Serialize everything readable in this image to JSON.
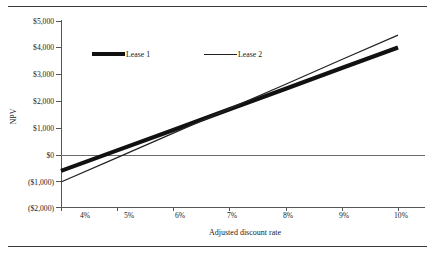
{
  "figure": {
    "top_caption": "",
    "axis_title_y": "NPV",
    "axis_title_x": "Adjusted discount rate"
  },
  "legend": {
    "items": [
      {
        "label": "Lease 1",
        "style": "thick"
      },
      {
        "label": "Lease 2",
        "style": "thin"
      }
    ]
  },
  "axes": {
    "y_ticks": [
      "$5,000",
      "$4,000",
      "$3,000",
      "$2,000",
      "$1,000",
      "$0",
      "($1,000)",
      "($2,000)"
    ],
    "x_ticks": [
      "4%",
      "5%",
      "6%",
      "7%",
      "8%",
      "9%",
      "10%"
    ]
  },
  "chart_data": {
    "type": "line",
    "title": "",
    "xlabel": "Adjusted discount rate",
    "ylabel": "NPV",
    "x": [
      4,
      5,
      6,
      7,
      8,
      9,
      10
    ],
    "x_tick_labels": [
      "4%",
      "5%",
      "6%",
      "7%",
      "8%",
      "9%",
      "10%"
    ],
    "y_tick_labels": [
      "$5,000",
      "$4,000",
      "$3,000",
      "$2,000",
      "$1,000",
      "$0",
      "($1,000)",
      "($2,000)"
    ],
    "y_tick_values": [
      5000,
      4000,
      3000,
      2000,
      1000,
      0,
      -1000,
      -2000
    ],
    "xlim": [
      3.6,
      10.4
    ],
    "ylim": [
      -2000,
      5000
    ],
    "grid": false,
    "legend_position": "top-left-inside",
    "reference_lines": [
      {
        "axis": "y",
        "value": 0,
        "label": "$0"
      }
    ],
    "series": [
      {
        "name": "Lease 1",
        "style": "thick",
        "color": "#111111",
        "values": [
          -640,
          130,
          900,
          1680,
          2450,
          3230,
          4000
        ]
      },
      {
        "name": "Lease 2",
        "style": "thin",
        "color": "#222222",
        "values": [
          -1060,
          -140,
          780,
          1700,
          2620,
          3550,
          4470
        ]
      }
    ],
    "annotations": [
      {
        "text": "series cross near 6.1% at about $980"
      }
    ]
  }
}
